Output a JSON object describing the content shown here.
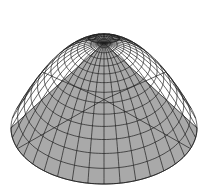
{
  "figure": {
    "colors": {
      "background": "#ffffff",
      "surface": "#a9a9a9",
      "mesh_line": "#1e1e1e"
    },
    "mesh": {
      "rings": 14,
      "meridians": 36,
      "apex": [
        104,
        44
      ],
      "base_center": [
        104,
        128
      ],
      "base_rx": 93,
      "base_ry": 56,
      "height": 118
    }
  }
}
